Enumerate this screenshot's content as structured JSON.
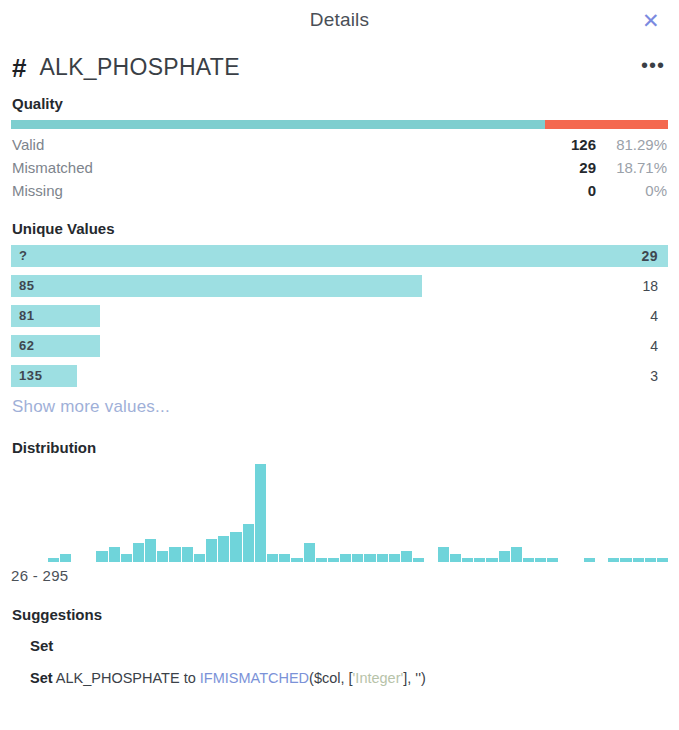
{
  "titlebar": {
    "title": "Details",
    "close_icon": "close-icon",
    "close_glyph": "✕"
  },
  "column": {
    "type_icon": "hash-icon",
    "type_glyph": "#",
    "name": "ALK_PHOSPHATE",
    "more_glyph": "•••"
  },
  "quality": {
    "heading": "Quality",
    "bar": {
      "valid_pct": 81.29,
      "mismatched_pct": 18.71,
      "missing_pct": 0,
      "valid_color": "#7ececf",
      "mismatched_color": "#f4684f",
      "missing_color": "#d9dde1"
    },
    "rows": [
      {
        "label": "Valid",
        "count": "126",
        "pct": "81.29%"
      },
      {
        "label": "Mismatched",
        "count": "29",
        "pct": "18.71%"
      },
      {
        "label": "Missing",
        "count": "0",
        "pct": "0%"
      }
    ]
  },
  "unique_values": {
    "heading": "Unique Values",
    "bar_color": "#9ddfe2",
    "rows": [
      {
        "value": "?",
        "count": "29",
        "width_pct": 100.0,
        "count_inside": true
      },
      {
        "value": "85",
        "count": "18",
        "width_pct": 62.5,
        "count_inside": false
      },
      {
        "value": "81",
        "count": "4",
        "width_pct": 13.5,
        "count_inside": false
      },
      {
        "value": "62",
        "count": "4",
        "width_pct": 13.5,
        "count_inside": false
      },
      {
        "value": "135",
        "count": "3",
        "width_pct": 10.1,
        "count_inside": false
      }
    ],
    "show_more_label": "Show more values..."
  },
  "distribution": {
    "heading": "Distribution",
    "range_label": "26 - 295",
    "bar_color": "#6fd4da"
  },
  "chart_data": {
    "type": "bar",
    "title": "Distribution",
    "xlabel": "26 - 295",
    "ylabel": "",
    "grid": false,
    "legend": null,
    "xlim": [
      26,
      295
    ],
    "ylim": [
      0,
      26
    ],
    "categories": [
      "26",
      "31",
      "36",
      "41",
      "46",
      "51",
      "56",
      "61",
      "66",
      "71",
      "76",
      "81",
      "86",
      "91",
      "96",
      "101",
      "106",
      "111",
      "116",
      "121",
      "126",
      "131",
      "136",
      "141",
      "146",
      "151",
      "156",
      "161",
      "166",
      "171",
      "176",
      "181",
      "186",
      "191",
      "196",
      "201",
      "206",
      "211",
      "216",
      "221",
      "226",
      "231",
      "236",
      "241",
      "246",
      "251",
      "256",
      "261",
      "266",
      "271",
      "276",
      "281",
      "286",
      "291"
    ],
    "values": [
      0,
      0,
      0,
      1,
      2,
      0,
      0,
      3,
      4,
      2,
      5,
      6,
      3,
      4,
      4,
      2,
      6,
      7,
      8,
      10,
      26,
      2,
      2,
      1,
      5,
      1,
      1,
      2,
      2,
      2,
      2,
      2,
      3,
      1,
      0,
      4,
      2,
      1,
      1,
      1,
      3,
      4,
      1,
      1,
      1,
      0,
      0,
      1,
      0,
      1,
      1,
      1,
      1,
      1
    ]
  },
  "suggestions": {
    "heading": "Suggestions",
    "groups": [
      {
        "label": "Set",
        "items": [
          {
            "keyword": "Set",
            "column": " ALK_PHOSPHATE to ",
            "function": "IFMISMATCHED",
            "open": "($col, [",
            "type_literal": "'Integer'",
            "close": "], '')"
          }
        ]
      }
    ]
  }
}
